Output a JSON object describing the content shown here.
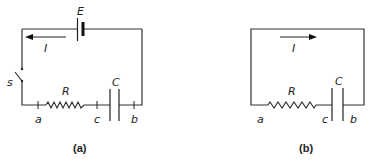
{
  "figure": {
    "panel_a": {
      "caption": "(a)",
      "labels": {
        "emf": "E",
        "current": "I",
        "switch": "s",
        "resistor": "R",
        "capacitor": "C",
        "node_a": "a",
        "node_c": "c",
        "node_b": "b"
      },
      "current_direction": "left"
    },
    "panel_b": {
      "caption": "(b)",
      "labels": {
        "current": "I",
        "resistor": "R",
        "capacitor": "C",
        "node_a": "a",
        "node_c": "c",
        "node_b": "b"
      },
      "current_direction": "right"
    }
  }
}
